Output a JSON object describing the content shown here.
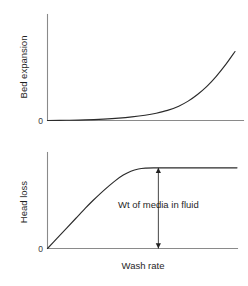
{
  "figure": {
    "background_color": "#ffffff",
    "axis_color": "#8a8a8a",
    "curve_color": "#2b2b2b",
    "text_color": "#1f1f1f",
    "zero_label": "0"
  },
  "chart_data": [
    {
      "type": "line",
      "title": "",
      "subtitle": "",
      "xlabel": "",
      "ylabel": "Bed expansion",
      "zero_tick_label": "0",
      "grid": false,
      "legend": "none",
      "xlim": [
        0,
        100
      ],
      "ylim": [
        0,
        100
      ],
      "axis_ticks": {
        "x": [],
        "y": []
      },
      "annotations": [],
      "series": [
        {
          "name": "Bed expansion vs wash rate",
          "x": [
            0,
            10,
            20,
            30,
            38,
            45,
            52,
            58,
            64,
            70,
            75,
            80,
            85,
            90,
            95,
            100
          ],
          "y": [
            0,
            0.3,
            0.8,
            1.8,
            3.0,
            4.6,
            6.8,
            9.4,
            13.0,
            18.5,
            25.0,
            33.5,
            44.0,
            57.0,
            72.0,
            89.0
          ]
        }
      ]
    },
    {
      "type": "line",
      "title": "",
      "subtitle": "",
      "xlabel": "Wash rate",
      "ylabel": "Head loss",
      "zero_tick_label": "0",
      "grid": false,
      "legend": "none",
      "xlim": [
        0,
        100
      ],
      "ylim": [
        0,
        100
      ],
      "axis_ticks": {
        "x": [],
        "y": []
      },
      "annotations": [
        {
          "name": "weight-of-media-annotation",
          "text": "Wt of media in fluid",
          "kind": "double-headed-arrow",
          "x": 58.5,
          "y_from": 0,
          "y_to": 84,
          "label_x": 58.5,
          "label_y": 42
        }
      ],
      "series": [
        {
          "name": "Head loss vs wash rate",
          "x": [
            0,
            5,
            10,
            15,
            20,
            24,
            28,
            32,
            36,
            40,
            44,
            48,
            52,
            56,
            60,
            70,
            80,
            90,
            100
          ],
          "y": [
            0,
            10.5,
            21.0,
            31.5,
            42.0,
            50.0,
            57.5,
            64.5,
            71.0,
            76.5,
            80.5,
            82.8,
            83.7,
            84.0,
            84.0,
            84.0,
            84.0,
            84.0,
            84.0
          ]
        }
      ]
    }
  ]
}
